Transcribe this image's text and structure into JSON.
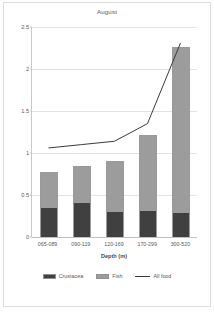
{
  "chart_data": {
    "type": "bar",
    "title": "August",
    "xlabel": "Depth (m)",
    "ylabel": "Stomach fullness (%)",
    "categories": [
      "065-089",
      "090-119",
      "120-169",
      "170-299",
      "300-520"
    ],
    "series": [
      {
        "name": "Crustacea",
        "color": "#404040",
        "type": "bar-stacked",
        "values": [
          0.34,
          0.41,
          0.3,
          0.31,
          0.29
        ]
      },
      {
        "name": "Fish",
        "color": "#9c9c9c",
        "type": "bar-stacked",
        "values": [
          0.43,
          0.44,
          0.61,
          0.9,
          1.97
        ]
      },
      {
        "name": "All food",
        "color": "#3a3a3a",
        "type": "line",
        "values": [
          1.06,
          1.1,
          1.14,
          1.35,
          2.31
        ]
      }
    ],
    "stack_totals": [
      0.77,
      0.85,
      0.91,
      1.21,
      2.26
    ],
    "ylim": [
      0,
      2.5
    ],
    "yticks": [
      0,
      0.5,
      1,
      1.5,
      2,
      2.5
    ],
    "ytick_labels": [
      "0",
      "0.5",
      "1",
      "1.5",
      "2",
      "2.5"
    ],
    "grid": true,
    "legend_position": "bottom"
  },
  "legend": {
    "items": [
      {
        "label": "Crustacea",
        "marker": "swatch-dark"
      },
      {
        "label": "Fish",
        "marker": "swatch-gray"
      },
      {
        "label": "All food",
        "marker": "line"
      }
    ]
  },
  "colors": {
    "crustacea": "#404040",
    "fish": "#9c9c9c",
    "line": "#3a3a3a",
    "grid": "#e2e2e2",
    "axis": "#c8c8c8",
    "text": "#5a5a5a",
    "background": "#ffffff"
  }
}
